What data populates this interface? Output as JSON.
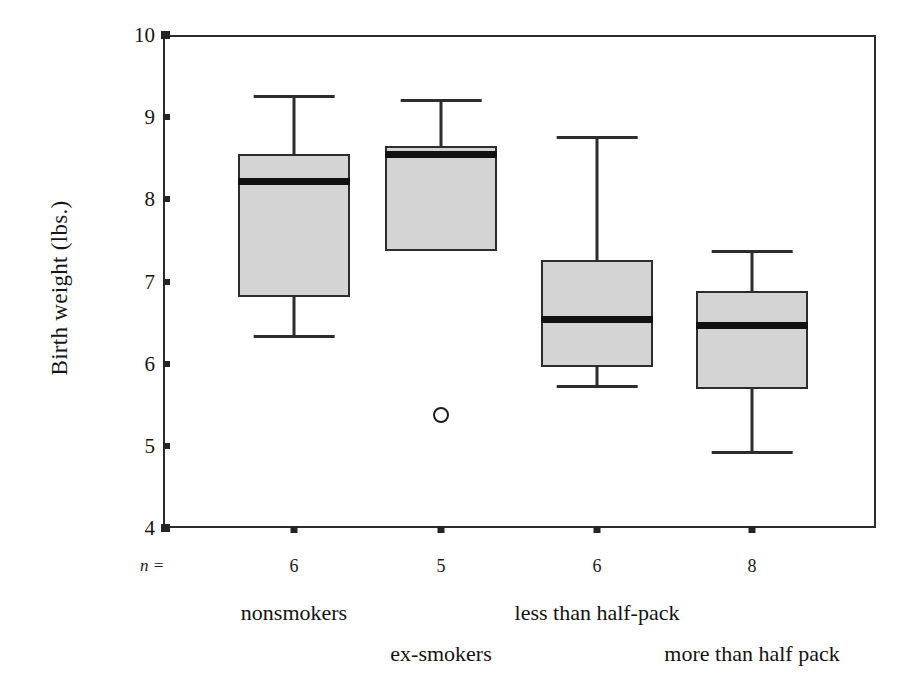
{
  "chart_data": {
    "type": "box",
    "title": "",
    "xlabel": "",
    "ylabel": "Birth weight (lbs.)",
    "ylim": [
      4,
      10
    ],
    "yticks": [
      4,
      5,
      6,
      7,
      8,
      9,
      10
    ],
    "ytick_labels": [
      "4",
      "5",
      "6",
      "7",
      "8",
      "9",
      "10"
    ],
    "grid": false,
    "legend": "none",
    "n_prefix": "n =",
    "categories": [
      "nonsmokers",
      "ex-smokers",
      "less than half-pack",
      "more than half pack"
    ],
    "counts": [
      "6",
      "5",
      "6",
      "8"
    ],
    "boxes": [
      {
        "label": "nonsmokers",
        "n": "6",
        "whisker_low": 6.35,
        "q1": 6.81,
        "median": 8.22,
        "q3": 8.55,
        "whisker_high": 9.27,
        "outliers": []
      },
      {
        "label": "ex-smokers",
        "n": "5",
        "whisker_low": 7.37,
        "q1": 7.37,
        "median": 8.54,
        "q3": 8.65,
        "whisker_high": 9.22,
        "outliers": [
          5.38
        ]
      },
      {
        "label": "less than half-pack",
        "n": "6",
        "whisker_low": 5.74,
        "q1": 5.96,
        "median": 6.54,
        "q3": 7.26,
        "whisker_high": 8.77,
        "outliers": []
      },
      {
        "label": "more than half pack",
        "n": "8",
        "whisker_low": 4.94,
        "q1": 5.69,
        "median": 6.47,
        "q3": 6.88,
        "whisker_high": 7.38,
        "outliers": []
      }
    ],
    "colors": {
      "box_fill": "#d4d4d4",
      "box_edge": "#2d2d2d",
      "median": "#111111",
      "axis": "#2b2b2b",
      "background": "#ffffff"
    }
  },
  "label_rows": [
    0,
    1,
    0,
    1
  ]
}
